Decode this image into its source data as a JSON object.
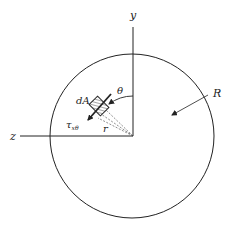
{
  "diagram": {
    "title": "",
    "labels": {
      "y_axis": "y",
      "z_axis": "z",
      "theta": "θ",
      "area_element": "dA",
      "shear_stress": "τ",
      "shear_stress_subscript": "xθ",
      "radius_to_element": "r",
      "outer_radius": "R"
    },
    "colors": {
      "line": "#222222",
      "background": "#ffffff"
    },
    "geometry": {
      "circle_center": [
        132,
        136
      ],
      "circle_radius": 82,
      "y_axis_top": 27,
      "z_axis_left": 20
    }
  }
}
